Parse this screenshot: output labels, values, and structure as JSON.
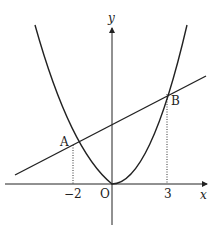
{
  "diagram": {
    "type": "function-graph",
    "labels": {
      "x_axis": "x",
      "y_axis": "y",
      "origin": "O",
      "point_a": "A",
      "point_b": "B",
      "tick_neg2": "−2",
      "tick_3": "3"
    },
    "points": {
      "A": {
        "x": -2
      },
      "B": {
        "x": 3
      },
      "O": {
        "x": 0,
        "y": 0
      }
    },
    "curves": [
      {
        "name": "parabola",
        "kind": "y = a x^2",
        "vertex": "O"
      },
      {
        "name": "line",
        "kind": "straight line through A and B"
      }
    ],
    "colors": {
      "stroke": "#222222",
      "background": "#ffffff"
    }
  }
}
